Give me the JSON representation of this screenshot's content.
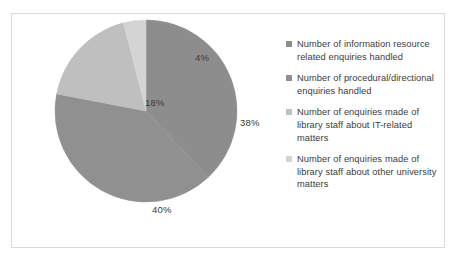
{
  "chart_data": {
    "type": "pie",
    "title": "",
    "subtitle": "",
    "xlabel": "",
    "ylabel": "",
    "grid": false,
    "legend_position": "right",
    "categories": [
      "Number of information resource related enquiries handled",
      "Number of procedural/directional enquiries handled",
      "Number of enquiries made of library staff about IT-related matters",
      "Number of enquiries made of library staff about other university matters"
    ],
    "values": [
      38,
      40,
      18,
      4
    ],
    "data_labels": [
      "38%",
      "40%",
      "18%",
      "4%"
    ],
    "colors": [
      "#8d8d8d",
      "#909090",
      "#bfbfbf",
      "#d4d4d4"
    ],
    "units": "percent",
    "total": 100,
    "start_angle_deg": 0,
    "direction": "clockwise"
  },
  "legend": {
    "items": [
      {
        "label": "Number of information resource related enquiries handled",
        "color": "#8d8d8d",
        "value": "38%"
      },
      {
        "label": "Number of procedural/directional enquiries handled",
        "color": "#909090",
        "value": "40%"
      },
      {
        "label": "Number of enquiries made of library staff about IT-related matters",
        "color": "#bfbfbf",
        "value": "18%"
      },
      {
        "label": "Number of enquiries made of library staff about other university matters",
        "color": "#d4d4d4",
        "value": "4%"
      }
    ]
  },
  "frame": {
    "border_color": "#d9d9d9",
    "background_color": "#ffffff"
  }
}
